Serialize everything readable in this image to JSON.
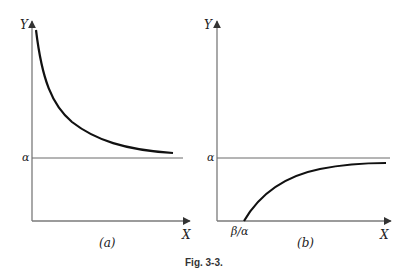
{
  "figure": {
    "caption": "Fig. 3-3.",
    "panels": [
      {
        "id": "a",
        "label": "(a)",
        "y_axis_label": "Y",
        "x_axis_label": "X",
        "asymptote_label": "α",
        "description": "Decreasing curve approaching horizontal asymptote α from above"
      },
      {
        "id": "b",
        "label": "(b)",
        "y_axis_label": "Y",
        "x_axis_label": "X",
        "asymptote_label": "α",
        "x_intercept_label": "β/α",
        "description": "Increasing curve starting at X = β/α approaching horizontal asymptote α from below"
      }
    ]
  },
  "colors": {
    "axis": "#7a7a7a",
    "curve": "#111111",
    "asymptote": "#6a6a6a",
    "text": "#222222"
  }
}
